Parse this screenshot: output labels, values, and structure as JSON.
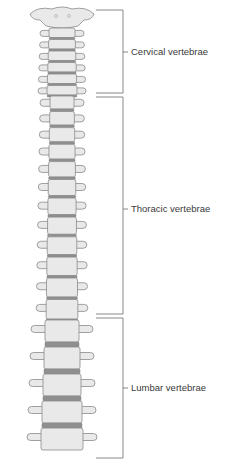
{
  "figure": {
    "colors": {
      "bone_fill": "#e9e9e9",
      "bone_stroke": "#8a8a8a",
      "disc_fill": "#8f8f8f",
      "bracket": "#7a7a7a",
      "text": "#3a3a3a"
    }
  },
  "regions": [
    {
      "id": "cervical",
      "label": "Cervical vertebrae",
      "count": 7,
      "bracket": {
        "top": 10,
        "bottom": 93,
        "tick_y": 52
      },
      "label_pos": {
        "x": 131,
        "y": 47
      }
    },
    {
      "id": "thoracic",
      "label": "Thoracic vertebrae",
      "count": 12,
      "bracket": {
        "top": 97,
        "bottom": 314,
        "tick_y": 209
      },
      "label_pos": {
        "x": 131,
        "y": 204
      }
    },
    {
      "id": "lumbar",
      "label": "Lumbar vertebrae",
      "count": 5,
      "bracket": {
        "top": 318,
        "bottom": 458,
        "tick_y": 388
      },
      "label_pos": {
        "x": 131,
        "y": 383
      }
    }
  ]
}
